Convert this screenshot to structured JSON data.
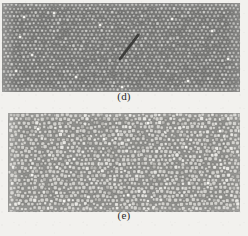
{
  "figure": {
    "background_color": "#f2f1ee",
    "width": 248,
    "height": 236,
    "kind": "micrograph-figure-two-panels"
  },
  "panels": [
    {
      "id": "d",
      "caption": "(d)",
      "description": "ordered dense packing of cells with a diagonal dislocation defect",
      "x": 2,
      "y": 3,
      "width": 238,
      "height": 89,
      "cell_fill": "#b9b9b6",
      "cell_stroke": "#4c4c4a",
      "matrix_color": "#7c7c7a",
      "lattice": "square-offset",
      "cell_size": 4.0,
      "cell_shape": "rounded-square",
      "rows": 22,
      "cols": 60,
      "defect": {
        "type": "diagonal-crack",
        "x1": 118,
        "y1": 56,
        "x2": 136,
        "y2": 32,
        "color": "#3a3a38",
        "width": 2.6
      },
      "bright_spots": [
        {
          "x": 22,
          "y": 14
        },
        {
          "x": 52,
          "y": 10
        },
        {
          "x": 18,
          "y": 34
        },
        {
          "x": 98,
          "y": 22
        },
        {
          "x": 30,
          "y": 52
        },
        {
          "x": 14,
          "y": 68
        },
        {
          "x": 186,
          "y": 78
        },
        {
          "x": 210,
          "y": 28
        },
        {
          "x": 226,
          "y": 56
        },
        {
          "x": 170,
          "y": 16
        },
        {
          "x": 74,
          "y": 74
        },
        {
          "x": 120,
          "y": 84
        }
      ]
    },
    {
      "id": "e",
      "caption": "(e)",
      "description": "lighter disordered polydisperse packing of cells",
      "x": 8,
      "y": 113,
      "width": 232,
      "height": 99,
      "cell_fill": "#d3d2ce",
      "cell_stroke": "#5a5a58",
      "matrix_color": "#8f8f8c",
      "lattice": "disordered-hex",
      "cell_size": 4.4,
      "cell_shape": "rounded-square",
      "rows": 23,
      "cols": 53,
      "defect": null,
      "bright_spots": [
        {
          "x": 30,
          "y": 16
        },
        {
          "x": 66,
          "y": 46
        },
        {
          "x": 96,
          "y": 26
        },
        {
          "x": 24,
          "y": 62
        },
        {
          "x": 140,
          "y": 10
        },
        {
          "x": 178,
          "y": 34
        },
        {
          "x": 200,
          "y": 70
        },
        {
          "x": 120,
          "y": 82
        },
        {
          "x": 56,
          "y": 88
        },
        {
          "x": 212,
          "y": 18
        }
      ]
    }
  ],
  "captions": {
    "d": {
      "text": "(d)",
      "x": 124,
      "y": 97
    },
    "e": {
      "text": "(e)",
      "x": 124,
      "y": 216
    }
  }
}
